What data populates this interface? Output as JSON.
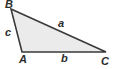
{
  "figure": {
    "kind": "geometry-diagram",
    "shape": "triangle",
    "width": 113,
    "height": 69,
    "background_color": "#ffffff"
  },
  "style": {
    "fill_color": "#ebebeb",
    "stroke_color": "#3a3a3a",
    "stroke_width": 1.6,
    "label_color": "#2b2b2b"
  },
  "vertices": [
    {
      "id": "B",
      "label": "B",
      "x": 11,
      "y": 9
    },
    {
      "id": "A",
      "label": "A",
      "x": 22,
      "y": 52
    },
    {
      "id": "C",
      "label": "C",
      "x": 106,
      "y": 52
    }
  ],
  "sides": [
    {
      "id": "a",
      "label": "a",
      "between": "B-C"
    },
    {
      "id": "b",
      "label": "b",
      "between": "A-C"
    },
    {
      "id": "c",
      "label": "c",
      "between": "A-B"
    }
  ],
  "polygon_points": "11,9 106,52 22,52"
}
